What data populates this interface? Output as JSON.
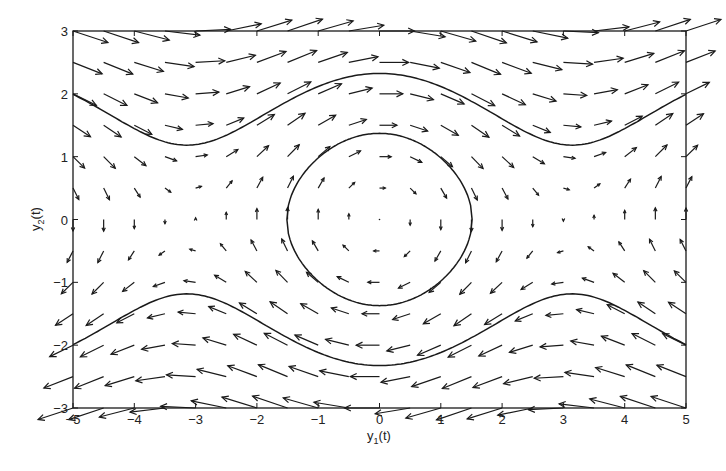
{
  "chart_data": {
    "type": "quiver",
    "title": "",
    "xlabel": "y1(t)",
    "ylabel": "y2(t)",
    "xlabel_main": "y",
    "xlabel_sub": "1",
    "xlabel_tail": "(t)",
    "ylabel_main": "y",
    "ylabel_sub": "2",
    "ylabel_tail": "(t)",
    "xlim": [
      -5,
      5
    ],
    "ylim": [
      -3,
      3
    ],
    "xticks": [
      -5,
      -4,
      -3,
      -2,
      -1,
      0,
      1,
      2,
      3,
      4,
      5
    ],
    "yticks": [
      -3,
      -2,
      -1,
      0,
      1,
      2,
      3
    ],
    "grid": false,
    "legend": null,
    "vector_field": {
      "equation": "y1' = y2, y2' = -sin(y1)",
      "x_grid": {
        "start": -5,
        "stop": 5,
        "step": 0.5
      },
      "y_grid": {
        "start": -3,
        "stop": 3,
        "step": 0.5
      },
      "arrow_scale": 0.19
    },
    "trajectories": [
      {
        "name": "closed orbit",
        "energy": -0.06,
        "branch": "closed",
        "samples": [
          [
            -1.51,
            0
          ],
          [
            -1,
            0.93
          ],
          [
            0,
            1.37
          ],
          [
            1,
            0.93
          ],
          [
            1.51,
            0
          ],
          [
            1,
            -0.93
          ],
          [
            0,
            -1.37
          ],
          [
            -1,
            -0.93
          ]
        ]
      },
      {
        "name": "upper running orbit",
        "energy": 1.7,
        "branch": "upper",
        "samples": [
          [
            -5,
            1.96
          ],
          [
            -4,
            1.57
          ],
          [
            -3.14,
            1.18
          ],
          [
            -2,
            1.63
          ],
          [
            -1,
            2.15
          ],
          [
            0,
            2.32
          ],
          [
            1,
            2.15
          ],
          [
            2,
            1.63
          ],
          [
            3.14,
            1.18
          ],
          [
            4,
            1.57
          ],
          [
            5,
            1.96
          ]
        ]
      },
      {
        "name": "lower running orbit",
        "energy": 1.7,
        "branch": "lower",
        "samples": [
          [
            -5,
            -1.96
          ],
          [
            -4,
            -1.57
          ],
          [
            -3.14,
            -1.18
          ],
          [
            -2,
            -1.63
          ],
          [
            -1,
            -2.15
          ],
          [
            0,
            -2.32
          ],
          [
            1,
            -2.15
          ],
          [
            2,
            -1.63
          ],
          [
            3.14,
            -1.18
          ],
          [
            4,
            -1.57
          ],
          [
            5,
            -1.96
          ]
        ]
      }
    ]
  },
  "style": {
    "line_color": "#1a1a1a",
    "axis_color": "#1a1a1a",
    "background": "#ffffff"
  },
  "layout": {
    "plot_left": 73,
    "plot_top": 31,
    "plot_right": 686,
    "plot_bottom": 408
  }
}
